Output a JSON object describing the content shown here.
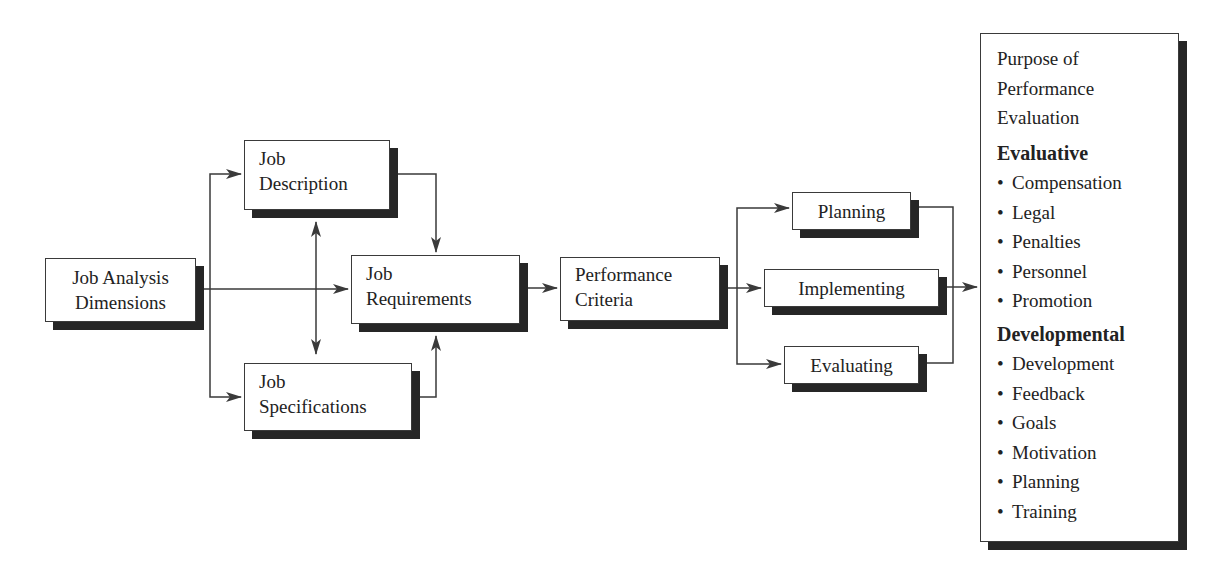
{
  "diagram": {
    "colors": {
      "line": "#3a3a3a",
      "shadow": "#262626",
      "box_fill": "#ffffff",
      "text": "#222222"
    },
    "nodes": {
      "job_analysis": {
        "label": "Job Analysis\nDimensions"
      },
      "job_description": {
        "label": "Job\nDescription"
      },
      "job_specifications": {
        "label": "Job\nSpecifications"
      },
      "job_requirements": {
        "label": "Job\nRequirements"
      },
      "performance_criteria": {
        "label": "Performance\nCriteria"
      },
      "planning": {
        "label": "Planning"
      },
      "implementing": {
        "label": "Implementing"
      },
      "evaluating": {
        "label": "Evaluating"
      }
    },
    "purpose": {
      "title": "Purpose of\nPerformance\nEvaluation",
      "sections": [
        {
          "heading": "Evaluative",
          "items": [
            "Compensation",
            "Legal",
            "Penalties",
            "Personnel",
            "Promotion"
          ]
        },
        {
          "heading": "Developmental",
          "items": [
            "Development",
            "Feedback",
            "Goals",
            "Motivation",
            "Planning",
            "Training"
          ]
        }
      ],
      "bullet": "•"
    },
    "edges": [
      {
        "from": "Job Analysis Dimensions",
        "to": "Job Description"
      },
      {
        "from": "Job Analysis Dimensions",
        "to": "Job Specifications"
      },
      {
        "from": "Job Analysis Dimensions",
        "to": "Job Requirements"
      },
      {
        "from": "Job Description",
        "to": "Job Specifications",
        "bidirectional": true
      },
      {
        "from": "Job Description",
        "to": "Job Requirements"
      },
      {
        "from": "Job Specifications",
        "to": "Job Requirements"
      },
      {
        "from": "Job Requirements",
        "to": "Performance Criteria"
      },
      {
        "from": "Performance Criteria",
        "to": "Planning"
      },
      {
        "from": "Performance Criteria",
        "to": "Implementing"
      },
      {
        "from": "Performance Criteria",
        "to": "Evaluating"
      },
      {
        "from": "Planning",
        "to": "Purpose of Performance Evaluation"
      },
      {
        "from": "Implementing",
        "to": "Purpose of Performance Evaluation"
      },
      {
        "from": "Evaluating",
        "to": "Purpose of Performance Evaluation"
      }
    ]
  }
}
